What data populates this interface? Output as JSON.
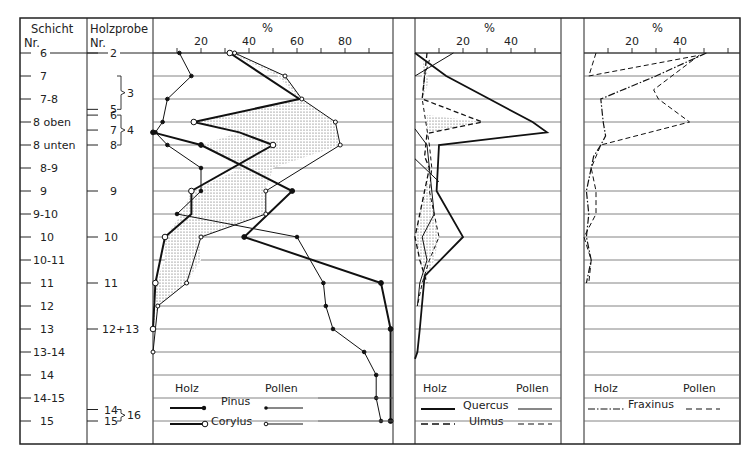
{
  "headers": {
    "schicht": "Schicht",
    "schicht_nr": "Nr.",
    "holzprobe": "Holzprobe",
    "holzprobe_nr": "Nr."
  },
  "schicht_labels": [
    "6",
    "7",
    "7-8",
    "8 oben",
    "8 unten",
    "8-9",
    "9",
    "9-10",
    "10",
    "10-11",
    "11",
    "12",
    "13",
    "13-14",
    "14",
    "14-15",
    "15"
  ],
  "holzprobe_labels": [
    {
      "row": 0,
      "label": "2"
    },
    {
      "row": 2,
      "label": "5",
      "offset": 0.45
    },
    {
      "row": 3,
      "label": "6",
      "offset": -0.3
    },
    {
      "row": 3,
      "label": "7",
      "offset": 0.35
    },
    {
      "row": 4,
      "label": "8"
    },
    {
      "row": 6,
      "label": "9"
    },
    {
      "row": 8,
      "label": "10"
    },
    {
      "row": 10,
      "label": "11"
    },
    {
      "row": 12,
      "label": "12+13"
    },
    {
      "row": 15,
      "label": "14",
      "offset": 0.5
    },
    {
      "row": 16,
      "label": "15"
    }
  ],
  "holzprobe_groups": [
    {
      "label": "3",
      "from_row": 1,
      "to_row": 2.45
    },
    {
      "label": "4",
      "from_row": 2.7,
      "to_row": 4
    },
    {
      "label": "16",
      "from_row": 15.5,
      "to_row": 16
    }
  ],
  "chart_data": [
    {
      "type": "line",
      "title": "%",
      "panel": "Pinus / Corylus",
      "xlabel": "%",
      "x_ticks": [
        20,
        40,
        60,
        80
      ],
      "xlim": [
        0,
        100
      ],
      "y_categories": [
        "6",
        "7",
        "7-8",
        "8 oben",
        "8 unten",
        "8-9",
        "9",
        "9-10",
        "10",
        "10-11",
        "11",
        "12",
        "13",
        "13-14",
        "14",
        "14-15",
        "15"
      ],
      "legend": {
        "holz_label": "Holz",
        "pollen_label": "Pollen"
      },
      "series": [
        {
          "name": "Pinus Holz",
          "rows": [
            4,
            5,
            6,
            7,
            8,
            9,
            10,
            11,
            12,
            13,
            14,
            15,
            16
          ],
          "values": [
            20,
            null,
            58,
            null,
            38,
            null,
            95,
            null,
            99,
            null,
            null,
            null,
            99
          ],
          "style": "thick-filled-dot"
        },
        {
          "name": "Pinus Pollen",
          "rows": [
            0,
            1,
            2,
            3,
            3.45,
            4,
            5,
            6,
            7,
            8,
            9,
            10,
            11,
            12,
            13,
            14,
            15,
            16
          ],
          "values": [
            11,
            16,
            6,
            4,
            1,
            6,
            null,
            null,
            null,
            58,
            null,
            null,
            null,
            null,
            null,
            null,
            null,
            null
          ],
          "style": "thin-filled-dot"
        },
        {
          "name": "Corylus Holz",
          "rows": [
            0,
            2,
            3,
            3.45,
            4,
            6,
            8,
            10,
            12
          ],
          "values": [
            32,
            61,
            17,
            null,
            null,
            16,
            null,
            1,
            0
          ],
          "style": "thick-open-dot"
        },
        {
          "name": "Corylus Pollen",
          "rows": [
            0,
            1,
            2,
            3,
            3.45,
            4,
            6,
            8,
            10,
            12,
            13
          ],
          "values": [
            34,
            55,
            62,
            76,
            36,
            78,
            47,
            null,
            null,
            null,
            0
          ],
          "style": "thin-open-dot"
        }
      ]
    },
    {
      "type": "line",
      "title": "%",
      "panel": "Quercus / Ulmus",
      "x_ticks": [
        20,
        40
      ],
      "xlim": [
        0,
        55
      ],
      "legend": {
        "holz_label": "Holz",
        "pollen_label": "Pollen"
      },
      "series": [
        {
          "name": "Quercus Holz",
          "rows": [
            0,
            1,
            2,
            3,
            3.45,
            4,
            6,
            8,
            10,
            12,
            14
          ],
          "values": [
            0,
            10,
            31,
            49,
            55,
            10,
            9,
            20,
            5,
            0,
            -1
          ]
        },
        {
          "name": "Quercus Pollen",
          "rows": [
            0,
            1,
            2
          ],
          "values": [
            16,
            0,
            null
          ]
        },
        {
          "name": "Ulmus Holz",
          "rows": [
            0,
            2,
            3,
            3.45,
            4,
            6,
            8,
            10
          ],
          "values": [
            5,
            4,
            28,
            4,
            6,
            7,
            9,
            3
          ]
        },
        {
          "name": "Ulmus Pollen",
          "rows": [
            0,
            2,
            3,
            4,
            6,
            8,
            10
          ],
          "values": [
            6,
            3,
            5,
            3,
            5,
            2,
            3
          ]
        }
      ]
    },
    {
      "type": "line",
      "title": "%",
      "panel": "Fraxinus",
      "x_ticks": [
        20,
        40
      ],
      "xlim": [
        0,
        55
      ],
      "legend": {
        "holz_label": "Holz",
        "pollen_label": "Pollen"
      },
      "series": [
        {
          "name": "Fraxinus Holz",
          "rows": [
            0,
            1,
            2,
            3,
            4,
            6,
            8,
            10
          ],
          "values": [
            50,
            30,
            7,
            9,
            7,
            1,
            1,
            1
          ]
        },
        {
          "name": "Fraxinus Pollen",
          "rows": [
            0,
            0.3,
            1,
            1.6,
            2,
            3,
            4,
            6,
            8,
            10
          ],
          "values": [
            5,
            3,
            1,
            28,
            31,
            44,
            7,
            2,
            6,
            2
          ]
        }
      ]
    }
  ],
  "legends": {
    "panel1": {
      "holz": "Holz",
      "pollen": "Pollen",
      "pinus": "Pinus",
      "corylus": "Corylus"
    },
    "panel2": {
      "holz": "Holz",
      "pollen": "Pollen",
      "quercus": "Quercus",
      "ulmus": "Ulmus"
    },
    "panel3": {
      "holz": "Holz",
      "pollen": "Pollen",
      "fraxinus": "Fraxinus"
    }
  },
  "axis": {
    "pct": "%",
    "ticks1": [
      "20",
      "40",
      "60",
      "80"
    ],
    "ticks2": [
      "20",
      "40"
    ],
    "ticks3": [
      "20",
      "40"
    ]
  }
}
